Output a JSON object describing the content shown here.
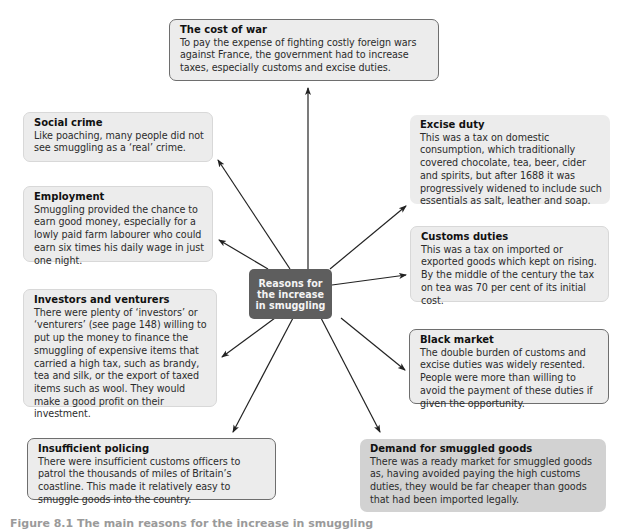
{
  "center": {
    "label": "Reasons for the increase in smuggling",
    "fill_color": "#5e5e5e"
  },
  "boxes": {
    "cost_of_war": {
      "title": "The cost of war",
      "body": "To pay the expense of fighting costly foreign wars against France, the government had to increase taxes, especially customs and excise duties."
    },
    "social_crime": {
      "title": "Social crime",
      "body": "Like poaching, many people did not see smuggling as a ‘real’ crime."
    },
    "employment": {
      "title": "Employment",
      "body": "Smuggling provided the chance to earn good money, especially for a lowly paid farm labourer who could earn six times his daily wage in just one night."
    },
    "investors": {
      "title": "Investors and venturers",
      "body": "There were plenty of ‘investors’ or ‘venturers’ (see page 148) willing to put up the money to finance the smuggling of expensive items that carried a high tax, such as brandy, tea and silk, or the export of taxed items such as wool. They would make a good profit on their investment."
    },
    "policing": {
      "title": "Insufficient policing",
      "body": "There were insufficient customs officers to patrol the thousands of miles of Britain’s coastline. This made it relatively easy to smuggle goods into the country."
    },
    "excise": {
      "title": "Excise duty",
      "body": "This was a tax on domestic consumption, which traditionally covered chocolate, tea, beer, cider and spirits, but after 1688 it was progressively widened to include such essentials as salt, leather and soap."
    },
    "customs": {
      "title": "Customs duties",
      "body": "This was a tax on imported or exported goods which kept on rising. By the middle of the century the tax on tea was 70 per cent of its initial cost."
    },
    "black_market": {
      "title": "Black market",
      "body": "The double burden of customs and excise duties was widely resented. People were more than willing to avoid the payment of these duties if given the opportunity."
    },
    "demand": {
      "title": "Demand for smuggled goods",
      "body": "There was a ready market for smuggled goods as, having avoided paying the high customs duties, they would be far cheaper than goods that had been imported legally."
    }
  },
  "caption": {
    "text": "Figure 8.1 The main reasons for the increase in smuggling"
  },
  "colors": {
    "box_fill": "#ececec",
    "box_fill_dark": "#d2d2d2",
    "arrow": "#222222"
  }
}
